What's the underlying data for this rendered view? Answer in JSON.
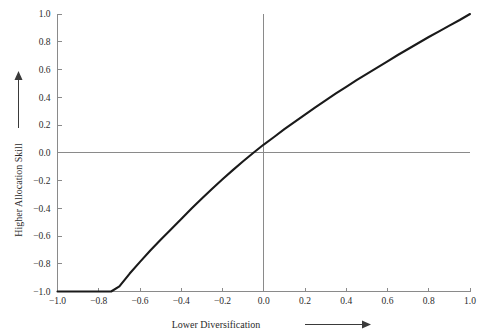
{
  "chart_data": {
    "type": "line",
    "title": "",
    "xlabel": "Lower Diversification",
    "ylabel": "Higher Allocation Skill",
    "xlim": [
      -1.0,
      1.0
    ],
    "ylim": [
      -1.0,
      1.0
    ],
    "grid": false,
    "legend": "none",
    "x_ticks": [
      "-1.0",
      "-0.8",
      "-0.6",
      "-0.4",
      "-0.2",
      "0.0",
      "0.2",
      "0.4",
      "0.6",
      "0.8",
      "1.0"
    ],
    "x_tick_values": [
      -1.0,
      -0.8,
      -0.6,
      -0.4,
      -0.2,
      0.0,
      0.2,
      0.4,
      0.6,
      0.8,
      1.0
    ],
    "y_ticks": [
      "-1.0",
      "-0.8",
      "-0.6",
      "-0.4",
      "-0.2",
      "0.0",
      "0.2",
      "0.4",
      "0.6",
      "0.8",
      "1.0"
    ],
    "y_tick_values": [
      -1.0,
      -0.8,
      -0.6,
      -0.4,
      -0.2,
      0.0,
      0.2,
      0.4,
      0.6,
      0.8,
      1.0
    ],
    "zero_lines": {
      "horizontal_y": 0.0,
      "vertical_x": 0.0
    },
    "series": [
      {
        "name": "curve",
        "color": "#1a1a1a",
        "x": [
          -1.0,
          -0.99,
          -0.98,
          -0.96,
          -0.94,
          -0.92,
          -0.9,
          -0.86,
          -0.82,
          -0.78,
          -0.74,
          -0.7,
          -0.65,
          -0.6,
          -0.55,
          -0.5,
          -0.46,
          -0.4,
          -0.35,
          -0.3,
          -0.25,
          -0.2,
          -0.15,
          -0.1,
          -0.05,
          0.0,
          0.05,
          0.1,
          0.15,
          0.2,
          0.25,
          0.3,
          0.35,
          0.4,
          0.45,
          0.5,
          0.55,
          0.6,
          0.65,
          0.7,
          0.75,
          0.8,
          0.85,
          0.9,
          0.95,
          1.0
        ],
        "y": [
          -1.0,
          -0.873,
          -0.825,
          -0.76,
          -0.713,
          -0.674,
          -0.64,
          -0.585,
          -0.538,
          -0.497,
          -0.459,
          -0.424,
          -0.383,
          -0.346,
          -0.31,
          -0.276,
          -0.25,
          -0.21,
          -0.177,
          -0.145,
          -0.114,
          -0.084,
          -0.055,
          -0.027,
          0.0,
          0.026,
          0.05,
          0.075,
          0.098,
          0.121,
          0.144,
          0.166,
          0.188,
          0.209,
          0.23,
          0.25,
          0.27,
          0.29,
          0.31,
          0.329,
          0.348,
          0.367,
          0.385,
          0.403,
          0.421,
          0.44
        ],
        "note": "Concave increasing curve passing through (-1,-1), crossing y=0 near x=-0.46, and rising to (1.0,1.0) at the plot frame"
      }
    ],
    "annotations": [
      {
        "name": "x-axis-arrow",
        "direction": "right",
        "label": "Lower Diversification"
      },
      {
        "name": "y-axis-arrow",
        "direction": "up",
        "label": "Higher Allocation Skill"
      }
    ],
    "colors": {
      "curve": "#1a1a1a",
      "axis": "#8a8a8a",
      "text": "#2b2b2b",
      "background": "#ffffff"
    }
  }
}
